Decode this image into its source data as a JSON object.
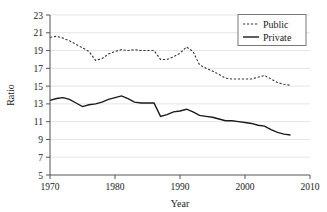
{
  "chart_data": {
    "type": "line",
    "title": "",
    "xlabel": "Year",
    "ylabel": "Ratio",
    "xlim": [
      1970,
      2010
    ],
    "ylim": [
      5,
      23
    ],
    "xticks": [
      1970,
      1980,
      1990,
      2000,
      2010
    ],
    "yticks": [
      5,
      7,
      9,
      11,
      13,
      15,
      17,
      19,
      21,
      23
    ],
    "grid": "horizontal",
    "legend_position": "top-right",
    "legend_entries": [
      "Public",
      "Private"
    ],
    "x": [
      1970,
      1971,
      1972,
      1973,
      1974,
      1975,
      1976,
      1977,
      1978,
      1979,
      1980,
      1981,
      1982,
      1983,
      1984,
      1985,
      1986,
      1987,
      1988,
      1989,
      1990,
      1991,
      1992,
      1993,
      1994,
      1995,
      1996,
      1997,
      1998,
      1999,
      2000,
      2001,
      2002,
      2003,
      2004,
      2005,
      2006,
      2007
    ],
    "series": [
      {
        "name": "Public",
        "style": "dashed",
        "color": "#333333",
        "values": [
          20.5,
          20.6,
          20.4,
          20.1,
          19.7,
          19.3,
          18.9,
          17.9,
          18.1,
          18.6,
          18.9,
          19.1,
          19.0,
          19.1,
          19.0,
          19.0,
          19.0,
          18.0,
          18.0,
          18.3,
          18.7,
          19.4,
          18.9,
          17.4,
          17.0,
          16.7,
          16.3,
          15.9,
          15.8,
          15.8,
          15.8,
          15.8,
          16.0,
          16.2,
          15.8,
          15.4,
          15.2,
          15.1
        ]
      },
      {
        "name": "Private",
        "style": "solid",
        "color": "#1a1a1a",
        "values": [
          13.4,
          13.6,
          13.7,
          13.5,
          13.1,
          12.7,
          12.9,
          13.0,
          13.2,
          13.5,
          13.7,
          13.9,
          13.6,
          13.2,
          13.1,
          13.1,
          13.1,
          11.6,
          11.8,
          12.1,
          12.2,
          12.4,
          12.1,
          11.7,
          11.6,
          11.5,
          11.3,
          11.1,
          11.1,
          11.0,
          10.9,
          10.8,
          10.6,
          10.5,
          10.1,
          9.8,
          9.6,
          9.5
        ]
      }
    ]
  },
  "axes": {
    "y_tick_labels": [
      "23",
      "21",
      "19",
      "17",
      "15",
      "13",
      "11",
      "9",
      "7",
      "5"
    ],
    "x_tick_labels": [
      "1970",
      "1980",
      "1990",
      "2000",
      "2010"
    ],
    "x_title": "Year",
    "y_title": "Ratio"
  },
  "legend": {
    "public_label": "Public",
    "private_label": "Private"
  },
  "colors": {
    "grid": "#d9d9d9",
    "axis": "#555555",
    "public": "#333333",
    "private": "#1a1a1a",
    "legend_border": "#777777",
    "text": "#1a1a1a"
  }
}
